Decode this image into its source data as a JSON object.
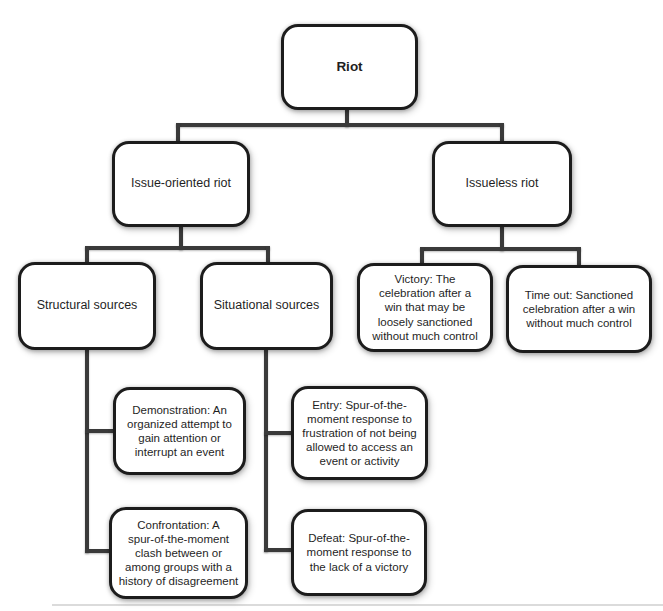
{
  "diagram": {
    "type": "tree-flowchart",
    "root_label": "Riot",
    "colors": {
      "line": "#3a3a3a",
      "border": "#1c1c1c",
      "fill": "#ffffff",
      "text": "#1f1f1f",
      "bg": "#ffffff"
    },
    "nodes": {
      "riot": {
        "label": "Riot"
      },
      "issue_oriented": {
        "label": "Issue-oriented riot"
      },
      "issueless": {
        "label": "Issueless riot"
      },
      "structural": {
        "label": "Structural sources"
      },
      "situational": {
        "label": "Situational sources"
      },
      "victory": {
        "label": "Victory: The\ncelebration after a\nwin that may be\nloosely sanctioned\nwithout much control"
      },
      "time_out": {
        "label": "Time out: Sanctioned\ncelebration after a win\nwithout much control"
      },
      "demonstration": {
        "label": "Demonstration: An\norganized attempt to\ngain attention or\ninterrupt an event"
      },
      "entry": {
        "label": "Entry: Spur-of-the-\nmoment response to\nfrustration of not being\nallowed to access an\nevent or activity"
      },
      "confrontation": {
        "label": "Confrontation: A\nspur-of-the-moment\nclash between or\namong groups with a\nhistory of disagreement"
      },
      "defeat": {
        "label": "Defeat: Spur-of-the-\nmoment response to\nthe lack of a victory"
      }
    },
    "edges": [
      {
        "from": "riot",
        "to": "issue_oriented"
      },
      {
        "from": "riot",
        "to": "issueless"
      },
      {
        "from": "issue_oriented",
        "to": "structural"
      },
      {
        "from": "issue_oriented",
        "to": "situational"
      },
      {
        "from": "issueless",
        "to": "victory"
      },
      {
        "from": "issueless",
        "to": "time_out"
      },
      {
        "from": "structural",
        "to": "demonstration"
      },
      {
        "from": "structural",
        "to": "confrontation"
      },
      {
        "from": "situational",
        "to": "entry"
      },
      {
        "from": "situational",
        "to": "defeat"
      }
    ]
  }
}
